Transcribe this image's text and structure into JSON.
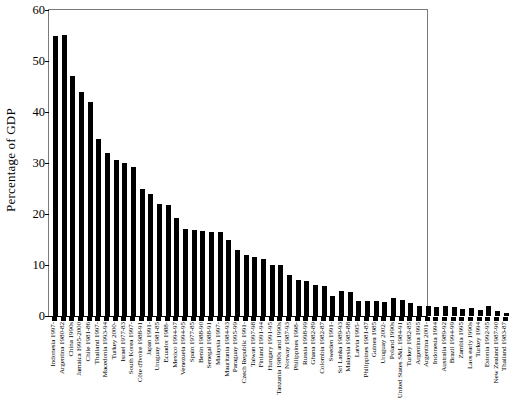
{
  "chart_data": {
    "type": "bar",
    "title": "",
    "subtitle": "",
    "xlabel": "",
    "ylabel": "Percentage of GDP",
    "ylim": [
      0,
      60
    ],
    "yticks": [
      0,
      10,
      20,
      30,
      40,
      50,
      60
    ],
    "grid": false,
    "legend": null,
    "bar_color": "#000000",
    "axis_color": "#000000",
    "frame_color": "#7a7a7a",
    "background": "#ffffff",
    "categories": [
      "Indonesia 1997-",
      "Argentina 1980-82",
      "China 1990s",
      "Jamaica 1995-2000",
      "Chile 1981-86",
      "Thailand 1997-",
      "Macedonia 1993-94",
      "Turkey 2000-",
      "Israel 1977-83",
      "South Korea 1997-",
      "Côte d'Ivoire 1988-91",
      "Japan 1991-",
      "Uruguay 1981-85",
      "Ecuador 1988-",
      "Mexico 1994-97",
      "Venezuela 1994-95",
      "Spain 1977-85",
      "Benin 1988-90",
      "Senegal 1988-91",
      "Malaysia 1997-",
      "Mauritania 1984-93",
      "Paraguay 1995-99",
      "Czech Republic 1991-",
      "Taiwan 1997-98",
      "Finland 1991-94",
      "Hungary 1991-95",
      "Tanzania 1980s and 1990s",
      "Norway 1987-93",
      "Philippines 1998-",
      "Russia 1998-99",
      "Ghana 1982-89",
      "Colombia 1982-87",
      "Sweden 1991-",
      "Sri Lanka 1989-93",
      "Malaysia 1985-88",
      "Latvia 1995-",
      "Philippines 1981-87",
      "Guinea 1985",
      "Uruguay 2002-",
      "Poland 1990s",
      "United States S&L 1984-91",
      "Turkey 1982-85",
      "Argentina 1995",
      "Argentina 2001-",
      "Indonesia 1994",
      "Australia 1989-92",
      "Brazil 1994-99",
      "Zambia 1995",
      "Laos early 1990s",
      "Turkey 1994",
      "Estonia 1992-95",
      "New Zealand 1987-90",
      "Thailand 1983-87"
    ],
    "values": [
      55.0,
      55.1,
      47.0,
      43.9,
      41.9,
      34.8,
      32.0,
      30.5,
      30.0,
      29.2,
      25.0,
      24.0,
      22.0,
      21.7,
      19.3,
      17.0,
      16.8,
      16.7,
      16.5,
      16.4,
      15.0,
      13.0,
      12.0,
      11.5,
      11.2,
      10.0,
      10.0,
      8.0,
      7.0,
      6.8,
      6.0,
      5.8,
      4.0,
      5.0,
      4.7,
      3.0,
      3.0,
      3.0,
      2.8,
      3.5,
      3.2,
      2.5,
      2.0,
      2.0,
      1.8,
      1.9,
      1.8,
      1.4,
      1.5,
      1.1,
      1.9,
      1.0,
      0.6
    ],
    "value_unit": "percent"
  },
  "axis": {
    "y_title": "Percentage of GDP",
    "y_tick_labels": [
      "0",
      "10",
      "20",
      "30",
      "40",
      "50",
      "60"
    ]
  }
}
